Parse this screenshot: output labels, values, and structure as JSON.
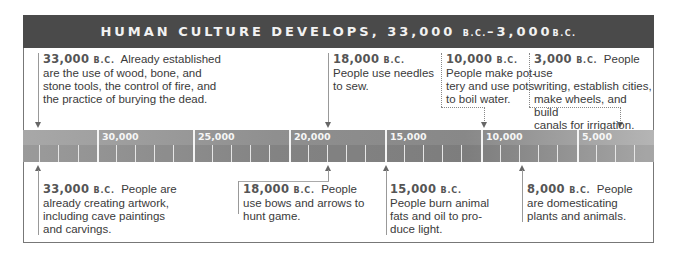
{
  "header": {
    "title_main": "HUMAN CULTURE DEVELOPS, 33,000 ",
    "title_bc1": "B.C.",
    "title_mid": "–3,000",
    "title_bc2": "B.C."
  },
  "bc_label": "B.C.",
  "ruler": {
    "ticks": [
      "30,000",
      "25,000",
      "20,000",
      "15,000",
      "10,000",
      "5,000"
    ],
    "colors": {
      "band": "#8f8f8f",
      "header": "#4a4a4a"
    }
  },
  "events_top": [
    {
      "year": "33,000",
      "text_inline": "Already established",
      "lines": [
        "are the use of wood, bone, and",
        "stone tools, the control of fire, and",
        "the practice of burying the dead."
      ]
    },
    {
      "year": "18,000",
      "text_inline": "",
      "lines": [
        "People use needles",
        "to sew."
      ]
    },
    {
      "year": "10,000",
      "text_inline": "",
      "lines": [
        "People make pot-",
        "tery and use pots",
        "to boil water."
      ]
    },
    {
      "year": "3,000",
      "text_inline": "People use",
      "lines": [
        "writing, establish cities,",
        "make wheels, and build",
        "canals for irrigation."
      ]
    }
  ],
  "events_bottom": [
    {
      "year": "33,000",
      "text_inline": "People are",
      "lines": [
        "already creating artwork,",
        "including cave paintings",
        "and carvings."
      ]
    },
    {
      "year": "18,000",
      "text_inline": "People",
      "lines": [
        "use bows and arrows to",
        "hunt game."
      ]
    },
    {
      "year": "15,000",
      "text_inline": "",
      "lines": [
        "People burn animal",
        "fats and oil to pro-",
        "duce light."
      ]
    },
    {
      "year": "8,000",
      "text_inline": "People",
      "lines": [
        "are domesticating",
        "plants and animals."
      ]
    }
  ]
}
